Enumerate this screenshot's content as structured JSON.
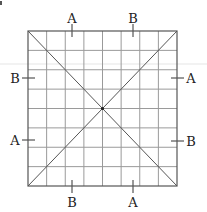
{
  "figure": {
    "grid": {
      "left": 28,
      "top": 31,
      "right": 177,
      "bottom": 186,
      "columns": 8,
      "rows": 8,
      "line_color": "#9a9a9a",
      "border_color": "#555555",
      "diagonal_color": "#555555"
    },
    "center_point": {
      "x": 102.5,
      "y": 108.5
    },
    "labels": {
      "top": [
        {
          "text": "A",
          "x": 72,
          "y": 18
        },
        {
          "text": "B",
          "x": 133,
          "y": 18
        }
      ],
      "bottom": [
        {
          "text": "B",
          "x": 72,
          "y": 202
        },
        {
          "text": "A",
          "x": 133,
          "y": 202
        }
      ],
      "left": [
        {
          "text": "B",
          "x": 15,
          "y": 78
        },
        {
          "text": "A",
          "x": 15,
          "y": 140
        }
      ],
      "right": [
        {
          "text": "A",
          "x": 191,
          "y": 78
        },
        {
          "text": "B",
          "x": 191,
          "y": 141
        }
      ]
    },
    "ticks": {
      "top": [
        {
          "x": 72,
          "y1": 24,
          "y2": 37
        },
        {
          "x": 133,
          "y1": 24,
          "y2": 37
        }
      ],
      "bottom": [
        {
          "x": 72,
          "y1": 180,
          "y2": 193
        },
        {
          "x": 133,
          "y1": 180,
          "y2": 193
        }
      ],
      "left": [
        {
          "y": 78,
          "x1": 22,
          "x2": 35
        },
        {
          "y": 140,
          "x1": 22,
          "x2": 35
        }
      ],
      "right": [
        {
          "y": 78,
          "x1": 171,
          "x2": 184
        },
        {
          "y": 141,
          "x1": 171,
          "x2": 184
        }
      ]
    }
  }
}
